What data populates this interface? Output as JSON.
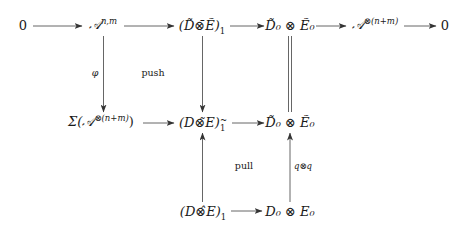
{
  "diagram": {
    "type": "commutative-diagram",
    "nodes": {
      "zero_left": "0",
      "a_nm_base": "𝒜",
      "a_nm_sup": "n,m",
      "dtilde_etilde_1": "(D̃⊗̄Ẽ)",
      "dtilde_etilde_1_sub": "1",
      "d0tilde_e0tilde_top": "D̃₀ ⊗ Ẽ₀",
      "a_tensor_base": "𝒜",
      "a_tensor_sup": "⊗(n+m)",
      "zero_right": "0",
      "sigma_open": "Σ(𝒜",
      "sigma_sup": "⊗(n+m)",
      "sigma_close": ")",
      "d_e_tilde_1": "(D⊗̃E)",
      "d_e_tilde_1_sup": "~",
      "d_e_tilde_1_sub": "1",
      "d0tilde_e0tilde_mid": "D̃₀ ⊗ Ẽ₀",
      "d_e_hat_1": "(D⊗̂E)",
      "d_e_hat_1_sub": "1",
      "d0_e0": "D₀ ⊗ E₀"
    },
    "labels": {
      "phi": "φ",
      "push": "push",
      "pull": "pull",
      "q_tensor_q": "q⊗q"
    },
    "edges": [
      {
        "from": "0",
        "to": "A^{n,m}",
        "style": "arrow"
      },
      {
        "from": "A^{n,m}",
        "to": "(D̃⊗̄Ẽ)_1",
        "style": "arrow"
      },
      {
        "from": "(D̃⊗̄Ẽ)_1",
        "to": "D̃₀⊗Ẽ₀",
        "style": "arrow"
      },
      {
        "from": "D̃₀⊗Ẽ₀",
        "to": "A^{⊗(n+m)}",
        "style": "arrow"
      },
      {
        "from": "A^{⊗(n+m)}",
        "to": "0",
        "style": "arrow"
      },
      {
        "from": "A^{n,m}",
        "to": "Σ(A^{⊗(n+m)})",
        "style": "arrow",
        "label": "φ"
      },
      {
        "from": "(D̃⊗̄Ẽ)_1",
        "to": "(D⊗̃E)_1^~",
        "style": "arrow"
      },
      {
        "from": "D̃₀⊗Ẽ₀ (top)",
        "to": "D̃₀⊗Ẽ₀ (mid)",
        "style": "double-line"
      },
      {
        "from": "Σ(A^{⊗(n+m)})",
        "to": "(D⊗̃E)_1^~",
        "style": "arrow"
      },
      {
        "from": "(D⊗̃E)_1^~",
        "to": "D̃₀⊗Ẽ₀ (mid)",
        "style": "arrow"
      },
      {
        "from": "(D⊗̂E)_1",
        "to": "(D⊗̃E)_1^~",
        "style": "arrow"
      },
      {
        "from": "D₀⊗E₀",
        "to": "D̃₀⊗Ẽ₀ (mid)",
        "style": "arrow",
        "label": "q⊗q"
      },
      {
        "from": "(D⊗̂E)_1",
        "to": "D₀⊗E₀",
        "style": "arrow"
      }
    ],
    "colors": {
      "stroke": "#444444",
      "text": "#1a1a1a",
      "background": "#ffffff"
    }
  }
}
